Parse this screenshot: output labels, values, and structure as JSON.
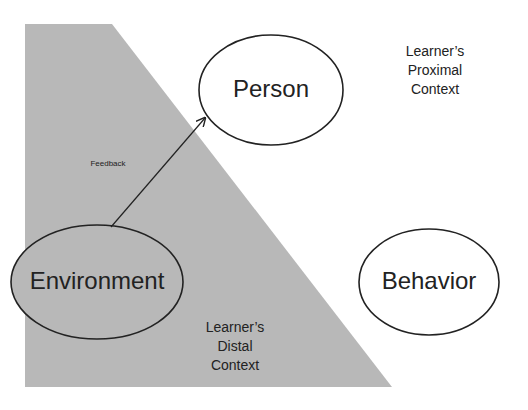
{
  "diagram": {
    "colors": {
      "background": "#ffffff",
      "distal_region": "#b8b8b8",
      "stroke": "#222222",
      "text": "#222222"
    },
    "regions": [
      {
        "id": "distal",
        "label": "Learner’s\nDistal\nContext",
        "lines": [
          "Learner’s",
          "Distal",
          "Context"
        ]
      },
      {
        "id": "proximal",
        "label": "Learner’s\nProximal\nContext",
        "lines": [
          "Learner’s",
          "Proximal",
          "Context"
        ]
      }
    ],
    "nodes": [
      {
        "id": "person",
        "label": "Person"
      },
      {
        "id": "environment",
        "label": "Environment"
      },
      {
        "id": "behavior",
        "label": "Behavior"
      }
    ],
    "edges": [
      {
        "from": "environment",
        "to": "person",
        "label": "Feedback"
      }
    ]
  }
}
